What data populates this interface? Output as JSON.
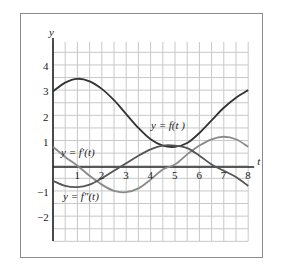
{
  "chart_data": {
    "type": "line",
    "title": "",
    "xlabel": "t",
    "ylabel": "y",
    "xlim": [
      0,
      8
    ],
    "ylim": [
      -3,
      5
    ],
    "grid": true,
    "grid_step": 0.5,
    "x_ticks": [
      "1",
      "2",
      "3",
      "4",
      "5",
      "6",
      "7",
      "8"
    ],
    "y_ticks": [
      "4",
      "3",
      "2",
      "1",
      "-1",
      "-2"
    ],
    "x": [
      0,
      0.5,
      1,
      1.5,
      2,
      2.5,
      3,
      3.5,
      4,
      4.5,
      5,
      5.5,
      6,
      6.5,
      7,
      7.5,
      8
    ],
    "series": [
      {
        "name": "y = f(t)",
        "label": "y = f(t )",
        "color": "#333333",
        "values": [
          3.0,
          3.35,
          3.5,
          3.4,
          3.1,
          2.65,
          2.1,
          1.55,
          1.1,
          0.85,
          0.8,
          0.95,
          1.35,
          1.85,
          2.35,
          2.75,
          3.05
        ]
      },
      {
        "name": "y = f'(t)",
        "label": "y = f′(t)",
        "color": "#8a8a8a",
        "values": [
          0.8,
          0.4,
          0.05,
          -0.35,
          -0.7,
          -0.95,
          -1.0,
          -0.85,
          -0.5,
          -0.1,
          0.1,
          0.5,
          0.85,
          1.1,
          1.2,
          1.1,
          0.8
        ]
      },
      {
        "name": "y = f''(t)",
        "label": "y = f″(t)",
        "color": "#555555",
        "values": [
          -0.55,
          -0.75,
          -0.8,
          -0.7,
          -0.45,
          -0.15,
          0.15,
          0.45,
          0.7,
          0.85,
          0.85,
          0.75,
          0.45,
          0.1,
          -0.15,
          -0.4,
          -0.75
        ]
      }
    ]
  }
}
